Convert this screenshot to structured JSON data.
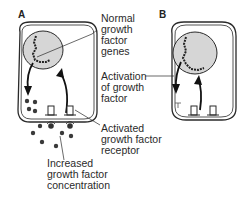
{
  "panels": {
    "a": {
      "label": "A"
    },
    "b": {
      "label": "B"
    }
  },
  "labels": {
    "normal_genes": "Normal\ngrowth\nfactor\ngenes",
    "activation": "Activation\nof growth\nfactor",
    "activated_receptor": "Activated\ngrowth factor\nreceptor",
    "increased_concentration": "Increased\ngrowth factor\nconcentration"
  },
  "colors": {
    "nucleus_fill": "#d6d6d6",
    "line": "#2a2a2a",
    "dot": "#3a3a3a"
  }
}
